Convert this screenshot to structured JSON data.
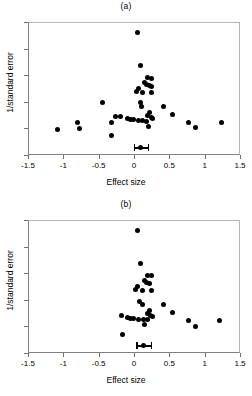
{
  "figure": {
    "xlabel": "Effect size",
    "ylabel": "1/standard error",
    "xticks": [
      "-1.5",
      "-1",
      "-0.5",
      "0",
      "0.5",
      "1",
      "1.5"
    ],
    "yticks": [
      "0",
      "2",
      "4",
      "6",
      "8",
      "10"
    ]
  },
  "panels": [
    {
      "title": "(a)"
    },
    {
      "title": "(b)"
    }
  ],
  "chart_data": [
    {
      "type": "scatter",
      "title": "(a)",
      "xlabel": "Effect size",
      "ylabel": "1/standard error",
      "xlim": [
        -1.5,
        1.5
      ],
      "ylim": [
        0,
        10
      ],
      "xticks": [
        -1.5,
        -1,
        -0.5,
        0,
        0.5,
        1,
        1.5
      ],
      "yticks": [
        0,
        2,
        4,
        6,
        8,
        10
      ],
      "grid": false,
      "legend": null,
      "points": [
        {
          "x": 0.03,
          "y": 9.3
        },
        {
          "x": 0.08,
          "y": 6.8
        },
        {
          "x": 0.18,
          "y": 5.9
        },
        {
          "x": 0.23,
          "y": 5.85
        },
        {
          "x": 0.14,
          "y": 5.5
        },
        {
          "x": 0.16,
          "y": 5.35
        },
        {
          "x": 0.21,
          "y": 5.3
        },
        {
          "x": 0.05,
          "y": 5.1
        },
        {
          "x": 0.24,
          "y": 5.2
        },
        {
          "x": 0.02,
          "y": 4.85
        },
        {
          "x": 0.1,
          "y": 4.75
        },
        {
          "x": 0.235,
          "y": 4.75
        },
        {
          "x": 0.08,
          "y": 4.0
        },
        {
          "x": -0.46,
          "y": 4.0
        },
        {
          "x": 0.09,
          "y": 3.75
        },
        {
          "x": 0.4,
          "y": 3.7
        },
        {
          "x": 0.21,
          "y": 3.3
        },
        {
          "x": 0.53,
          "y": 3.15
        },
        {
          "x": 0.17,
          "y": 3.05
        },
        {
          "x": -0.27,
          "y": 3.0
        },
        {
          "x": -0.2,
          "y": 2.95
        },
        {
          "x": 0.23,
          "y": 2.9
        },
        {
          "x": 0.245,
          "y": 2.85
        },
        {
          "x": -0.1,
          "y": 2.8
        },
        {
          "x": -0.06,
          "y": 2.75
        },
        {
          "x": -0.02,
          "y": 2.72
        },
        {
          "x": 0.05,
          "y": 2.7
        },
        {
          "x": 0.11,
          "y": 2.68
        },
        {
          "x": 0.16,
          "y": 2.62
        },
        {
          "x": 1.23,
          "y": 2.55
        },
        {
          "x": -0.33,
          "y": 2.55
        },
        {
          "x": 0.75,
          "y": 2.55
        },
        {
          "x": -0.82,
          "y": 2.55
        },
        {
          "x": 0.19,
          "y": 2.2
        },
        {
          "x": 0.86,
          "y": 2.15
        },
        {
          "x": -1.1,
          "y": 2.0
        },
        {
          "x": -0.78,
          "y": 2.05
        },
        {
          "x": -0.33,
          "y": 1.55
        }
      ],
      "summary_marker": {
        "x": 0.08,
        "y": 0.62,
        "ci_low": -0.02,
        "ci_high": 0.2
      }
    },
    {
      "type": "scatter",
      "title": "(b)",
      "xlabel": "Effect size",
      "ylabel": "1/standard error",
      "xlim": [
        -1.5,
        1.5
      ],
      "ylim": [
        0,
        10
      ],
      "xticks": [
        -1.5,
        -1,
        -0.5,
        0,
        0.5,
        1,
        1.5
      ],
      "yticks": [
        0,
        2,
        4,
        6,
        8,
        10
      ],
      "grid": false,
      "legend": null,
      "points": [
        {
          "x": 0.03,
          "y": 9.3
        },
        {
          "x": 0.08,
          "y": 6.8
        },
        {
          "x": 0.18,
          "y": 5.9
        },
        {
          "x": 0.235,
          "y": 5.9
        },
        {
          "x": 0.14,
          "y": 5.5
        },
        {
          "x": 0.16,
          "y": 5.35
        },
        {
          "x": 0.21,
          "y": 5.3
        },
        {
          "x": 0.04,
          "y": 5.1
        },
        {
          "x": 0.01,
          "y": 4.85
        },
        {
          "x": 0.11,
          "y": 4.78
        },
        {
          "x": 0.235,
          "y": 4.75
        },
        {
          "x": 0.06,
          "y": 3.95
        },
        {
          "x": 0.1,
          "y": 3.75
        },
        {
          "x": 0.4,
          "y": 3.7
        },
        {
          "x": 0.21,
          "y": 3.3
        },
        {
          "x": 0.53,
          "y": 3.1
        },
        {
          "x": 0.17,
          "y": 3.05
        },
        {
          "x": -0.19,
          "y": 2.92
        },
        {
          "x": 0.22,
          "y": 2.9
        },
        {
          "x": 0.245,
          "y": 2.85
        },
        {
          "x": -0.11,
          "y": 2.72
        },
        {
          "x": -0.06,
          "y": 2.68
        },
        {
          "x": -0.02,
          "y": 2.65
        },
        {
          "x": 0.05,
          "y": 2.62
        },
        {
          "x": 0.12,
          "y": 2.62
        },
        {
          "x": 0.17,
          "y": 2.6
        },
        {
          "x": 1.2,
          "y": 2.5
        },
        {
          "x": 0.75,
          "y": 2.55
        },
        {
          "x": 0.14,
          "y": 2.25
        },
        {
          "x": 0.86,
          "y": 2.05
        },
        {
          "x": -0.18,
          "y": 1.5
        }
      ],
      "summary_marker": {
        "x": 0.12,
        "y": 0.62,
        "ci_low": 0.02,
        "ci_high": 0.24
      }
    }
  ]
}
